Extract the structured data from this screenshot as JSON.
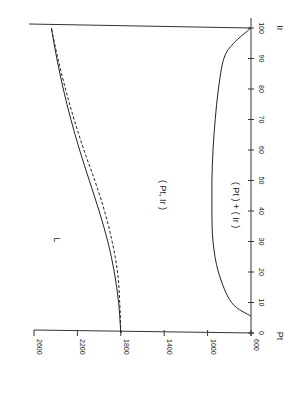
{
  "chart_data": {
    "type": "line",
    "orientation": "rotated 90 degrees (Ir axis vertical on right, value axis horizontal at bottom)",
    "title": "",
    "xlabel": "Ir",
    "ylabel": "Pt",
    "x_ticks": [
      0,
      10,
      20,
      30,
      40,
      50,
      60,
      70,
      80,
      90,
      100
    ],
    "y_ticks": [
      600,
      1000,
      1400,
      1800,
      2200,
      2600
    ],
    "xlim": [
      0,
      100
    ],
    "ylim": [
      600,
      2600
    ],
    "annotations": [
      "L",
      "( Pt, Ir )",
      "( Pt ) + ( Ir )"
    ],
    "series": [
      {
        "name": "( Pt, Ir )",
        "style": "solid",
        "x": [
          0,
          10,
          20,
          30,
          40,
          50,
          60,
          70,
          80,
          90,
          100
        ],
        "values": [
          1800,
          1820,
          1860,
          1920,
          2000,
          2090,
          2180,
          2260,
          2330,
          2390,
          2440
        ]
      },
      {
        "name": "( Pt, Ir ) dashed",
        "style": "dashed",
        "x": [
          0,
          10,
          20,
          30,
          40,
          50,
          60,
          70,
          80,
          90,
          100
        ],
        "values": [
          1800,
          1810,
          1830,
          1880,
          1950,
          2040,
          2140,
          2230,
          2310,
          2380,
          2440
        ]
      },
      {
        "name": "( Pt ) + ( Ir )",
        "style": "solid (dashed near Ir=90-100)",
        "x": [
          5.5,
          10,
          20,
          30,
          40,
          50,
          60,
          70,
          80,
          90,
          95,
          100
        ],
        "values": [
          600,
          780,
          900,
          950,
          960,
          960,
          950,
          930,
          900,
          850,
          760,
          600
        ]
      }
    ],
    "grid": false,
    "legend": "none (inline labels)"
  },
  "labels": {
    "L": "L",
    "pt_ir": "( Pt, Ir )",
    "pt_plus_ir": "( Pt ) + ( Ir )",
    "x_axis": "Ir",
    "y_axis": "Pt"
  }
}
